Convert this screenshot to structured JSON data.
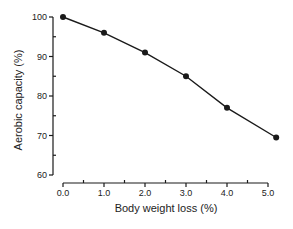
{
  "chart_data": {
    "type": "line",
    "title": "",
    "xlabel": "Body weight loss (%)",
    "ylabel": "Aerobic capacity (%)",
    "x": [
      0.0,
      1.0,
      2.0,
      3.0,
      4.0,
      5.2
    ],
    "series": [
      {
        "name": "Aerobic capacity",
        "values": [
          100,
          96,
          91,
          85,
          77,
          69.5
        ]
      }
    ],
    "xlim": [
      0,
      5
    ],
    "ylim": [
      60,
      100
    ],
    "xticks": [
      "0.0",
      "1.0",
      "2.0",
      "3.0",
      "4.0",
      "5.0"
    ],
    "xticks_minor": [
      0.5,
      1.5,
      2.5,
      3.5,
      4.5
    ],
    "yticks": [
      "60",
      "70",
      "80",
      "90",
      "100"
    ],
    "yticks_minor": [
      65,
      75,
      85,
      95
    ],
    "grid": false,
    "legend": null,
    "marker": "filled-circle",
    "line_color": "#1a1a1a"
  }
}
